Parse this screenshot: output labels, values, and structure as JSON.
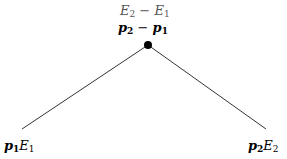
{
  "diagram": {
    "top_node": {
      "label_line1": {
        "a": "E",
        "a_sub": "2",
        "op": " − ",
        "b": "E",
        "b_sub": "1"
      },
      "label_line2": {
        "a": "p",
        "a_sub": "2",
        "op": " − ",
        "b": "p",
        "b_sub": "1"
      }
    },
    "left_leaf": {
      "p": "p",
      "p_sub": "1",
      "e": "E",
      "e_sub": "1"
    },
    "right_leaf": {
      "p": "p",
      "p_sub": "2",
      "e": "E",
      "e_sub": "2"
    },
    "colors": {
      "line": "#000000",
      "top_label_line1": "#555555"
    }
  }
}
